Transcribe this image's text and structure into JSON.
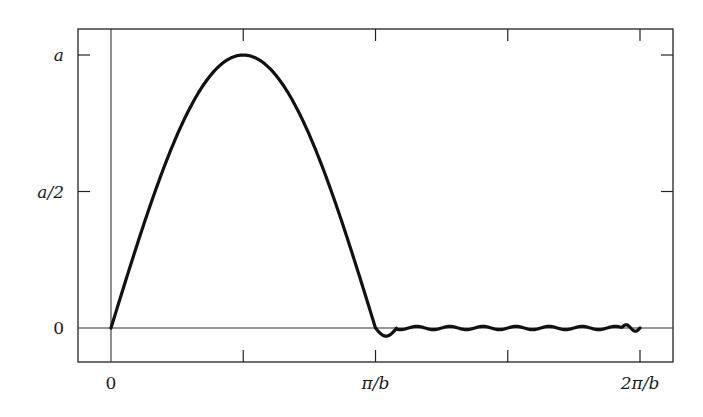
{
  "chart_data": {
    "type": "line",
    "title": "",
    "xlabel": "",
    "ylabel": "",
    "x_ticks": [
      {
        "value": 0,
        "label": "0"
      },
      {
        "value": 0.5,
        "label": ""
      },
      {
        "value": 1,
        "label": "π/b"
      },
      {
        "value": 1.5,
        "label": ""
      },
      {
        "value": 2,
        "label": "2π/b"
      }
    ],
    "y_ticks": [
      {
        "value": 0,
        "label": "0"
      },
      {
        "value": 0.5,
        "label": "a/2"
      },
      {
        "value": 1,
        "label": "a"
      }
    ],
    "x_unit": "π/b",
    "y_unit": "a",
    "xlim": [
      -0.125,
      2.125
    ],
    "ylim": [
      -0.125,
      1.1
    ],
    "grid": false,
    "legend": null,
    "reference_lines": {
      "horizontal_zero": true,
      "vertical_zero": true
    },
    "series": [
      {
        "name": "half-sine pulse",
        "description": "a·sin(bx) for 0 ≤ x ≤ π/b, approximately 0 (small ripple) for π/b < x ≤ 2π/b",
        "x": [
          0,
          0.125,
          0.25,
          0.375,
          0.5,
          0.625,
          0.75,
          0.875,
          1.0,
          1.05,
          1.25,
          1.5,
          1.75,
          1.95,
          2.0
        ],
        "y": [
          0,
          0.38,
          0.71,
          0.92,
          1.0,
          0.92,
          0.71,
          0.38,
          0,
          -0.03,
          0.0,
          0.0,
          0.0,
          0.01,
          -0.03
        ]
      }
    ]
  }
}
